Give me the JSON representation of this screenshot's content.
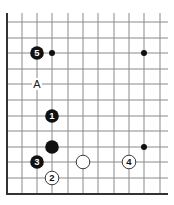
{
  "diagram": {
    "type": "go-board-fragment",
    "grid": {
      "columns_x": [
        7,
        22,
        37,
        52,
        68,
        83,
        98,
        114,
        129,
        144,
        160
      ],
      "rows_y": [
        22,
        38,
        53,
        69,
        84,
        100,
        116,
        131,
        147,
        162,
        178,
        194
      ],
      "top_y": 13,
      "right_x": 168,
      "left_edge_x": 7,
      "bottom_edge_y": 194,
      "line_color": "#8a8a8a",
      "edge_color": "#333333"
    },
    "star_points": [
      {
        "x": 52,
        "y": 53
      },
      {
        "x": 144,
        "y": 53
      },
      {
        "x": 144,
        "y": 147
      }
    ],
    "stones": [
      {
        "color": "black",
        "x": 37,
        "y": 53,
        "label": "5"
      },
      {
        "color": "black",
        "x": 52,
        "y": 116,
        "label": "1"
      },
      {
        "color": "black",
        "x": 52,
        "y": 147,
        "label": ""
      },
      {
        "color": "black",
        "x": 37,
        "y": 162,
        "label": "3"
      },
      {
        "color": "white",
        "x": 52,
        "y": 178,
        "label": "2"
      },
      {
        "color": "white",
        "x": 83,
        "y": 162,
        "label": ""
      },
      {
        "color": "white",
        "x": 129,
        "y": 162,
        "label": "4"
      }
    ],
    "markers": [
      {
        "x": 37,
        "y": 84,
        "label": "A"
      }
    ]
  }
}
